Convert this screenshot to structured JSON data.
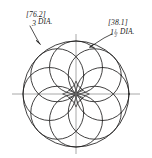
{
  "drawing": {
    "title": "Rosette / flower-of-life layout drawing",
    "sheet": {
      "width": 152,
      "height": 158,
      "background": "#ffffff",
      "line_color": "#201f1f",
      "centerline_color": "#8c8c8c"
    },
    "annotations": [
      {
        "id": "outer-circle-dimension",
        "metric_bracket": "[76.2]",
        "imperial_value": "3",
        "imperial_fraction_numerator": "",
        "imperial_fraction_denominator": "",
        "suffix": "DIA.",
        "position": "upper-left",
        "leader_target": "outer-circle"
      },
      {
        "id": "petal-circle-dimension",
        "metric_bracket": "[38.1]",
        "imperial_value": "1",
        "imperial_fraction_numerator": "1",
        "imperial_fraction_denominator": "2",
        "suffix": "DIA.",
        "position": "upper-right",
        "leader_target": "petal-circle"
      }
    ],
    "geometry": {
      "center_x": 76,
      "center_y": 94,
      "outer_radius": 53,
      "petal_radius": 26.5,
      "petal_count": 8,
      "petal_ring_radius": 26.5,
      "centerline_h_extent": [
        12,
        140
      ],
      "centerline_v_extent": [
        34,
        154
      ]
    }
  }
}
